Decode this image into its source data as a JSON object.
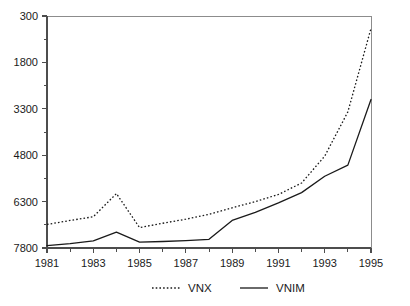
{
  "chart_data": {
    "type": "line",
    "title": "",
    "subtitle": "",
    "xlabel": "",
    "ylabel": "",
    "grid": false,
    "legend_position": "bottom",
    "xlim": [
      1981,
      1995
    ],
    "ylim": [
      300,
      7800
    ],
    "x_ticks_major": [
      1981,
      1983,
      1985,
      1987,
      1989,
      1991,
      1993,
      1995
    ],
    "x_ticks_minor": [
      1982,
      1984,
      1986,
      1988,
      1990,
      1992,
      1994
    ],
    "y_ticks_major": [
      300,
      1800,
      3300,
      4800,
      6300,
      7800
    ],
    "y_ticks_minor": [
      1050,
      2550,
      4050,
      5550,
      7050
    ],
    "x": [
      1981,
      1982,
      1983,
      1984,
      1985,
      1986,
      1987,
      1988,
      1989,
      1990,
      1991,
      1992,
      1993,
      1994,
      1995
    ],
    "series": [
      {
        "name": "VNX",
        "style": "dotted",
        "color": "#1a1a1a",
        "values": [
          1060,
          1190,
          1310,
          2060,
          960,
          1100,
          1230,
          1390,
          1600,
          1800,
          2030,
          2400,
          3270,
          4700,
          7400
        ]
      },
      {
        "name": "VNIM",
        "style": "solid",
        "color": "#1a1a1a",
        "values": [
          380,
          440,
          530,
          810,
          490,
          510,
          540,
          580,
          1190,
          1450,
          1760,
          2090,
          2620,
          2980,
          5100
        ]
      }
    ],
    "legend": [
      {
        "label": "VNX",
        "style": "dotted"
      },
      {
        "label": "VNIM",
        "style": "solid"
      }
    ]
  },
  "axis": {
    "y_labels": [
      "7800",
      "6300",
      "4800",
      "3300",
      "1800",
      "300"
    ],
    "x_labels": [
      "1981",
      "1983",
      "1985",
      "1987",
      "1989",
      "1991",
      "1993",
      "1995"
    ]
  },
  "legend": {
    "items": [
      {
        "label": "VNX"
      },
      {
        "label": "VNIM"
      }
    ]
  }
}
